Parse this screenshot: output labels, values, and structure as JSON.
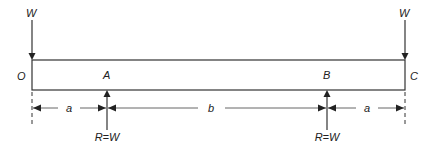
{
  "diagram": {
    "type": "beam-loading",
    "loads": [
      {
        "label": "W",
        "position": "O",
        "direction": "down"
      },
      {
        "label": "W",
        "position": "C",
        "direction": "down"
      }
    ],
    "points": [
      {
        "label": "O"
      },
      {
        "label": "A"
      },
      {
        "label": "B"
      },
      {
        "label": "C"
      }
    ],
    "reactions": [
      {
        "label": "R=W",
        "position": "A",
        "direction": "up"
      },
      {
        "label": "R=W",
        "position": "B",
        "direction": "up"
      }
    ],
    "dimensions": [
      {
        "label": "a",
        "from": "O",
        "to": "A"
      },
      {
        "label": "b",
        "from": "A",
        "to": "B"
      },
      {
        "label": "a",
        "from": "B",
        "to": "C"
      }
    ]
  }
}
